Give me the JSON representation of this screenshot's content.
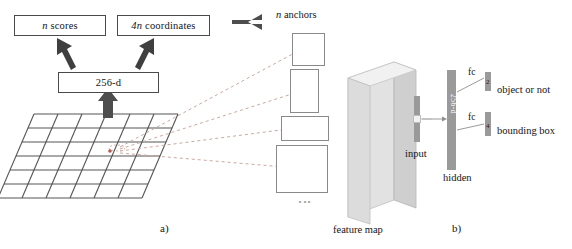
{
  "figure": {
    "caption_a": "a)",
    "caption_b": "b)"
  },
  "panel_a": {
    "boxes": [
      {
        "name": "n-scores",
        "label": "n scores",
        "italic_prefix": "n",
        "rest": " scores"
      },
      {
        "name": "4n-coordinates",
        "label": "4n coordinates",
        "italic_prefix": "4n",
        "rest": " coordinates"
      },
      {
        "name": "intermediate-256d",
        "label": "256-d"
      }
    ],
    "anchors_label": "n anchors",
    "anchors_italic": "n",
    "anchors_rest": " anchors",
    "anchor_count_visible": 4,
    "anchor_ellipsis": "⋮",
    "grid": {
      "rows": 7,
      "cols": 7,
      "marker_color": "#b05a48"
    },
    "arrows": [
      {
        "name": "arrow-256d-to-scores",
        "direction": "up-left"
      },
      {
        "name": "arrow-256d-to-coords",
        "direction": "up-right"
      },
      {
        "name": "arrow-grid-to-256d",
        "direction": "up"
      },
      {
        "name": "arrow-anchors-to-network",
        "direction": "left"
      }
    ],
    "dashed_connector_count": 4
  },
  "panel_b": {
    "feature_map_label": "feature map",
    "input_label": "input",
    "hidden_label": "hidden",
    "hidden_dim_label": "256-d",
    "fc_label_top": "fc",
    "fc_label_bottom": "fc",
    "output_top_label": "object or not",
    "output_bottom_label": "bounding box",
    "output_top_dim": "2",
    "output_bottom_dim": "4"
  },
  "colors": {
    "background": "#ffffff",
    "ink": "#141414",
    "box_border": "#4a4a4a",
    "anchor_border": "#8a8a8a",
    "arrow_fill": "#4d4d4d",
    "dashed_line": "#c9a9a0",
    "bar_gray": "#9a9a9a",
    "cuboid_front": "#e2e2e2",
    "cuboid_side": "#c8c8c8",
    "cuboid_top": "#efefef",
    "grid_line": "#555555"
  }
}
